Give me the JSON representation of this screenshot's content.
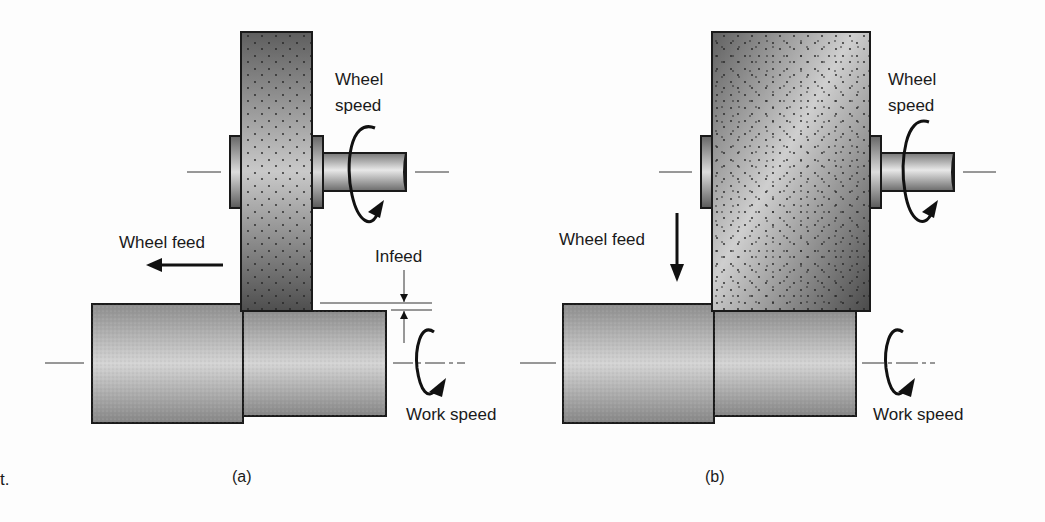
{
  "figure": {
    "left_margin_text": "t.",
    "panel_a": {
      "caption": "(a)",
      "labels": {
        "wheel_speed_line1": "Wheel",
        "wheel_speed_line2": "speed",
        "wheel_feed": "Wheel feed",
        "infeed": "Infeed",
        "work_speed": "Work speed"
      }
    },
    "panel_b": {
      "caption": "(b)",
      "labels": {
        "wheel_speed_line1": "Wheel",
        "wheel_speed_line2": "speed",
        "wheel_feed": "Wheel feed",
        "work_speed": "Work speed"
      }
    }
  },
  "colors": {
    "wheel_dark": "#5a5a5a",
    "wheel_light": "#c8c8c8",
    "work_dark": "#8a8a8a",
    "work_light": "#d2d2d2",
    "outline": "#1a1a1a"
  }
}
